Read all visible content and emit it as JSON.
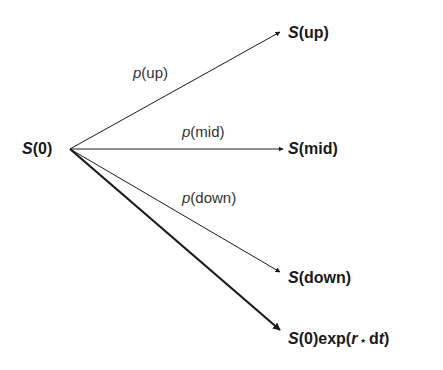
{
  "diagram": {
    "type": "trinomial-tree",
    "root": {
      "label_sym": "S",
      "label_arg": "(0)"
    },
    "branches": [
      {
        "id": "up",
        "prob_sym": "p",
        "prob_arg": "(up)",
        "node_sym": "S",
        "node_arg": "(up)"
      },
      {
        "id": "mid",
        "prob_sym": "p",
        "prob_arg": "(mid)",
        "node_sym": "S",
        "node_arg": "(mid)"
      },
      {
        "id": "down",
        "prob_sym": "p",
        "prob_arg": "(down)",
        "node_sym": "S",
        "node_arg": "(down)"
      },
      {
        "id": "expected",
        "node_sym": "S",
        "node_arg_pre": "(0)exp(",
        "node_r": "r",
        "node_star": " ⋆ ",
        "node_d": "d",
        "node_t": "t",
        "node_close": ")"
      }
    ],
    "colors": {
      "line": "#1a1a1a",
      "text": "#1a1a1a"
    }
  }
}
